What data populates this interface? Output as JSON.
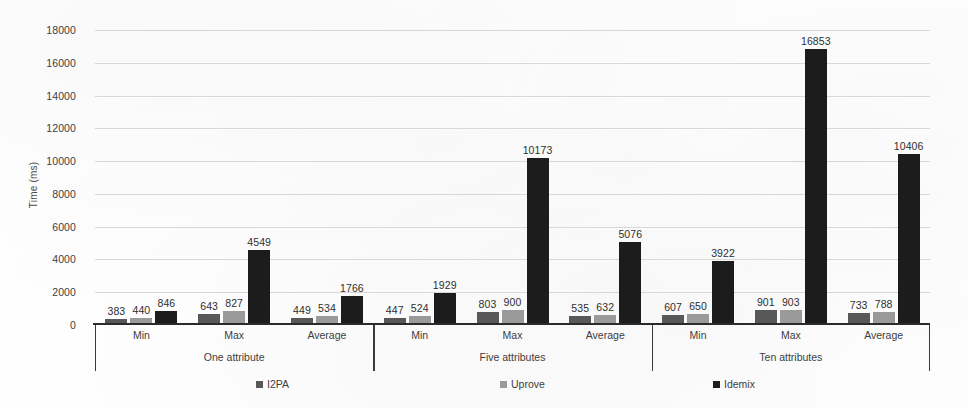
{
  "chart_data": {
    "type": "bar",
    "title": "",
    "subtitle": "",
    "xlabel": "",
    "ylabel": "Time (ms)",
    "ylim": [
      0,
      18000
    ],
    "ytick_step": 2000,
    "yticks": [
      0,
      2000,
      4000,
      6000,
      8000,
      10000,
      12000,
      14000,
      16000,
      18000
    ],
    "ytick_labels": [
      "0",
      "2000",
      "4000",
      "6000",
      "8000",
      "10000",
      "12000",
      "14000",
      "16000",
      "18000"
    ],
    "grid": true,
    "grid_axis": "y",
    "legend_position": "bottom",
    "group_labels": [
      "One attribute",
      "Five attributes",
      "Ten attributes"
    ],
    "categories": [
      "Min",
      "Max",
      "Average"
    ],
    "series": [
      {
        "name": "I2PA",
        "color": "#585858",
        "values_by_group": {
          "One attribute": [
            383,
            643,
            449
          ],
          "Five attributes": [
            447,
            803,
            535
          ],
          "Ten attributes": [
            607,
            901,
            733
          ]
        }
      },
      {
        "name": "Uprove",
        "color": "#9a9a9a",
        "values_by_group": {
          "One attribute": [
            440,
            827,
            534
          ],
          "Five attributes": [
            524,
            900,
            632
          ],
          "Ten attributes": [
            650,
            903,
            788
          ]
        }
      },
      {
        "name": "Idemix",
        "color": "#1c1c1c",
        "values_by_group": {
          "One attribute": [
            846,
            4549,
            1766
          ],
          "Five attributes": [
            1929,
            10173,
            5076
          ],
          "Ten attributes": [
            3922,
            16853,
            10406
          ]
        }
      }
    ],
    "data_labels": [
      [
        "383",
        "440",
        "846",
        "643",
        "827",
        "4549",
        "449",
        "534",
        "1766"
      ],
      [
        "447",
        "524",
        "1929",
        "803",
        "900",
        "10173",
        "535",
        "632",
        "5076"
      ],
      [
        "607",
        "650",
        "3922",
        "901",
        "903",
        "16853",
        "733",
        "788",
        "10406"
      ]
    ]
  },
  "legend": {
    "items": [
      {
        "label": "I2PA",
        "color": "#585858"
      },
      {
        "label": "Uprove",
        "color": "#9a9a9a"
      },
      {
        "label": "Idemix",
        "color": "#1c1c1c"
      }
    ]
  },
  "axis": {
    "y_title": "Time (ms)"
  }
}
